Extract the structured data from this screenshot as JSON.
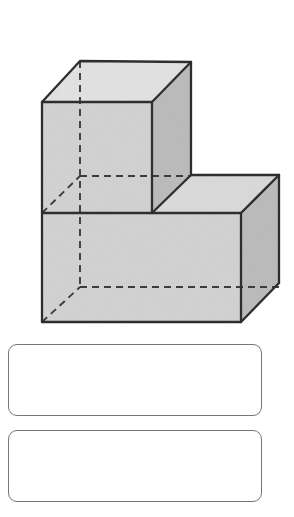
{
  "page": {
    "background_color": "#ffffff",
    "width": 294,
    "height": 517
  },
  "figure": {
    "name": "solid-figure-l-shaped-block",
    "colors": {
      "outline": "#333333",
      "top_face": "#e3e3e3",
      "front_face": "#d2d2d2",
      "side_face": "#bcbcbc",
      "hidden_edge": "#444444"
    },
    "stroke_width": 2,
    "hidden_edge_dash": "7,5",
    "polygons": {
      "upper_top_face": "80,61 191,62 152,102 42,102",
      "upper_front_face": "42,102 152,102 152,213 42,213",
      "upper_side_face": "152,102 191,62 191,175 152,213",
      "step_top_face": "152,213 191,175 279,175 241,213",
      "lower_top_strip": "152,213 241,213 279,175 279,175",
      "lower_front_face": "42,213 241,213 241,322 42,322",
      "lower_side_face": "241,213 279,175 279,283 241,322"
    },
    "solid_edges": [
      "80,61 191,62",
      "80,61 42,102",
      "191,62 152,102",
      "42,102 152,102",
      "42,102 42,322",
      "152,102 152,213",
      "191,62 191,175",
      "191,175 279,175",
      "152,213 191,175",
      "241,213 279,175",
      "42,213 152,213",
      "152,213 241,213",
      "241,213 241,322",
      "279,175 279,283",
      "42,322 241,322",
      "241,322 279,283"
    ],
    "hidden_edges": [
      "80,61 80,287",
      "80,176 191,176",
      "42,213 80,176",
      "80,287 279,287",
      "42,322 80,287"
    ]
  },
  "answers": {
    "label": "answer-entry-boxes",
    "boxes": [
      {
        "name": "answer-box-1",
        "value": "",
        "placeholder": ""
      },
      {
        "name": "answer-box-2",
        "value": "",
        "placeholder": ""
      }
    ]
  }
}
